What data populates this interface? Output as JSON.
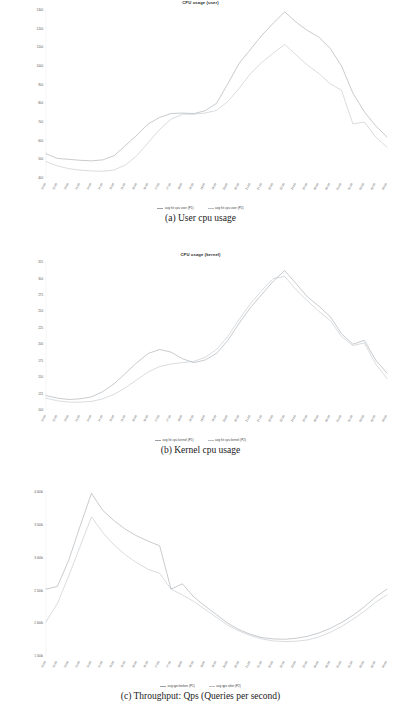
{
  "page": {
    "background": "#ffffff",
    "width": 401,
    "height": 719
  },
  "figures": [
    {
      "id": "figure-a",
      "caption": "(a) User cpu usage",
      "chart_data": {
        "type": "line",
        "title": "CPU usage (user)",
        "xlabel": "",
        "ylabel": "",
        "grid": false,
        "legend_position": "bottom",
        "ylim": [
          400,
          1300
        ],
        "yticks": [
          1300,
          1200,
          1100,
          1000,
          900,
          800,
          700,
          600,
          500,
          400
        ],
        "ytick_labels": [
          "1300",
          "1200",
          "1100",
          "1000",
          "900",
          "800",
          "700",
          "600",
          "500",
          "400"
        ],
        "categories": [
          "12:00",
          "12:30",
          "13:00",
          "13:30",
          "14:00",
          "14:30",
          "15:00",
          "15:30",
          "16:00",
          "16:30",
          "17:00",
          "17:30",
          "18:00",
          "18:30",
          "19:00",
          "19:30",
          "20:00",
          "20:30",
          "21:00",
          "21:30",
          "22:00",
          "22:30",
          "23:00",
          "23:30",
          "00:00",
          "00:30",
          "01:00",
          "01:30",
          "02:00",
          "02:30",
          "03:00"
        ],
        "series": [
          {
            "name": "avg hit cpu user (P1)",
            "color": "#9aa0a6",
            "values": [
              530,
              505,
              500,
              495,
              492,
              497,
              520,
              575,
              630,
              690,
              725,
              745,
              748,
              745,
              760,
              800,
              905,
              1015,
              1090,
              1165,
              1230,
              1290,
              1235,
              1190,
              1155,
              1095,
              1000,
              855,
              755,
              680,
              620
            ]
          },
          {
            "name": "avg hit cpu user (P2)",
            "color": "#b9bec4",
            "values": [
              488,
              465,
              450,
              442,
              438,
              436,
              443,
              470,
              520,
              590,
              660,
              715,
              742,
              742,
              748,
              762,
              810,
              880,
              960,
              1020,
              1070,
              1115,
              1060,
              1005,
              960,
              905,
              870,
              690,
              700,
              620,
              565
            ]
          }
        ]
      },
      "legend": [
        {
          "label": "avg hit cpu user (P1)",
          "color": "#9aa0a6"
        },
        {
          "label": "avg hit cpu user (P2)",
          "color": "#b9bec4"
        }
      ]
    },
    {
      "id": "figure-b",
      "caption": "(b) Kernel cpu usage",
      "chart_data": {
        "type": "line",
        "title": "CPU usage (kernel)",
        "xlabel": "",
        "ylabel": "",
        "grid": false,
        "legend_position": "bottom",
        "ylim": [
          100,
          325
        ],
        "yticks": [
          325,
          300,
          275,
          250,
          225,
          200,
          175,
          150,
          125,
          100
        ],
        "ytick_labels": [
          "325",
          "300",
          "275",
          "250",
          "225",
          "200",
          "175",
          "150",
          "125",
          "100"
        ],
        "categories": [
          "12:00",
          "12:30",
          "13:00",
          "13:30",
          "14:00",
          "14:30",
          "15:00",
          "15:30",
          "16:00",
          "16:30",
          "17:00",
          "17:30",
          "18:00",
          "18:30",
          "19:00",
          "19:30",
          "20:00",
          "20:30",
          "21:00",
          "21:30",
          "22:00",
          "22:30",
          "23:00",
          "23:30",
          "00:00",
          "00:30",
          "01:00",
          "01:30",
          "02:00",
          "02:30",
          "03:00"
        ],
        "series": [
          {
            "name": "avg hit cpu kernel (P1)",
            "color": "#9aa0a6",
            "values": [
              122,
              118,
              116,
              117,
              120,
              128,
              140,
              156,
              172,
              186,
              192,
              188,
              178,
              172,
              176,
              186,
              206,
              232,
              256,
              276,
              296,
              312,
              292,
              272,
              258,
              242,
              216,
              200,
              206,
              176,
              156
            ]
          },
          {
            "name": "avg hit cpu kernel (P2)",
            "color": "#b9bec4",
            "values": [
              118,
              114,
              112,
              112,
              113,
              117,
              124,
              134,
              146,
              158,
              166,
              170,
              172,
              174,
              180,
              192,
              212,
              238,
              262,
              282,
              300,
              303,
              283,
              266,
              250,
              236,
              212,
              198,
              202,
              170,
              148
            ]
          }
        ]
      },
      "legend": [
        {
          "label": "avg hit cpu kernel (P1)",
          "color": "#9aa0a6"
        },
        {
          "label": "avg hit cpu kernel (P2)",
          "color": "#b9bec4"
        }
      ]
    },
    {
      "id": "figure-c",
      "caption": "(c) Throughput: Qps (Queries per second)",
      "chart_data": {
        "type": "line",
        "title": "",
        "xlabel": "",
        "ylabel": "",
        "grid": false,
        "legend_position": "bottom",
        "ylim": [
          1500000,
          4000000
        ],
        "yticks": [
          4000000,
          3500000,
          3000000,
          2500000,
          2000000,
          1500000
        ],
        "ytick_labels": [
          "4 000k",
          "3 500k",
          "3 000k",
          "2 500k",
          "2 000k",
          "1 500k"
        ],
        "categories": [
          "12:00",
          "12:30",
          "13:00",
          "13:30",
          "14:00",
          "14:30",
          "15:00",
          "15:30",
          "16:00",
          "16:30",
          "17:00",
          "17:30",
          "18:00",
          "18:30",
          "19:00",
          "19:30",
          "20:00",
          "20:30",
          "21:00",
          "21:30",
          "22:00",
          "22:30",
          "23:00",
          "23:30",
          "00:00",
          "00:30",
          "01:00",
          "01:30",
          "02:00",
          "02:30",
          "03:00"
        ],
        "series": [
          {
            "name": "avg qps before (P1)",
            "color": "#9aa0a6",
            "values": [
              2520000,
              2560000,
              2960000,
              3480000,
              3980000,
              3720000,
              3560000,
              3430000,
              3330000,
              3250000,
              3180000,
              2520000,
              2600000,
              2400000,
              2260000,
              2130000,
              2000000,
              1900000,
              1830000,
              1780000,
              1760000,
              1755000,
              1770000,
              1800000,
              1850000,
              1920000,
              2010000,
              2120000,
              2250000,
              2400000,
              2520000
            ]
          },
          {
            "name": "avg qps after (P2)",
            "color": "#b9bec4",
            "values": [
              2020000,
              2300000,
              2720000,
              3170000,
              3620000,
              3380000,
              3190000,
              3040000,
              2920000,
              2820000,
              2760000,
              2520000,
              2430000,
              2330000,
              2210000,
              2090000,
              1970000,
              1880000,
              1810000,
              1760000,
              1730000,
              1720000,
              1725000,
              1745000,
              1790000,
              1860000,
              1950000,
              2060000,
              2180000,
              2320000,
              2430000
            ]
          }
        ]
      },
      "legend": [
        {
          "label": "avg qps before (P1)",
          "color": "#9aa0a6"
        },
        {
          "label": "avg qps after (P2)",
          "color": "#b9bec4"
        }
      ]
    }
  ]
}
